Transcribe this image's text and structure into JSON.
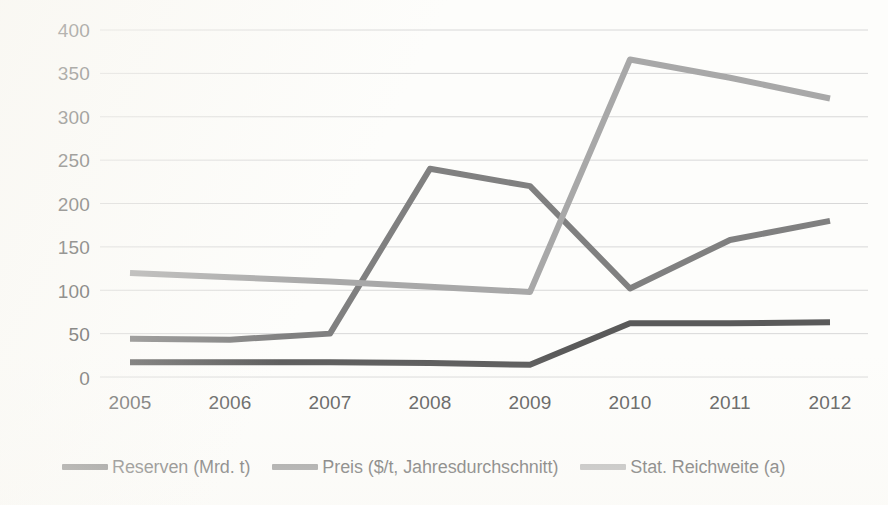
{
  "chart_data": {
    "type": "line",
    "title": "",
    "xlabel": "",
    "ylabel": "",
    "categories": [
      "2005",
      "2006",
      "2007",
      "2008",
      "2009",
      "2010",
      "2011",
      "2012"
    ],
    "ylim": [
      0,
      400
    ],
    "ytick_step": 50,
    "yticks": [
      "400",
      "350",
      "300",
      "250",
      "200",
      "150",
      "100",
      "50",
      "0"
    ],
    "grid": true,
    "legend_position": "bottom",
    "series": [
      {
        "name": "Reserven (Mrd. t)",
        "color": "#5a5a5a",
        "values": [
          17,
          17,
          17,
          16,
          14,
          62,
          62,
          63
        ]
      },
      {
        "name": "Preis ($/t, Jahresdurchschnitt)",
        "color": "#808080",
        "values": [
          44,
          43,
          50,
          240,
          220,
          102,
          158,
          180
        ]
      },
      {
        "name": "Stat. Reichweite (a)",
        "color": "#a8a8a8",
        "values": [
          120,
          115,
          110,
          104,
          98,
          366,
          345,
          321
        ]
      }
    ]
  },
  "legend": {
    "items": [
      {
        "label": "Reserven (Mrd. t)",
        "color": "#5a5a5a"
      },
      {
        "label": "Preis ($/t, Jahresdurchschnitt)",
        "color": "#808080"
      },
      {
        "label": "Stat. Reichweite (a)",
        "color": "#a8a8a8"
      }
    ]
  },
  "colors": {
    "background": "#fdfdfb",
    "gridline": "#d8d8d8",
    "text": "#3f3f3f"
  }
}
